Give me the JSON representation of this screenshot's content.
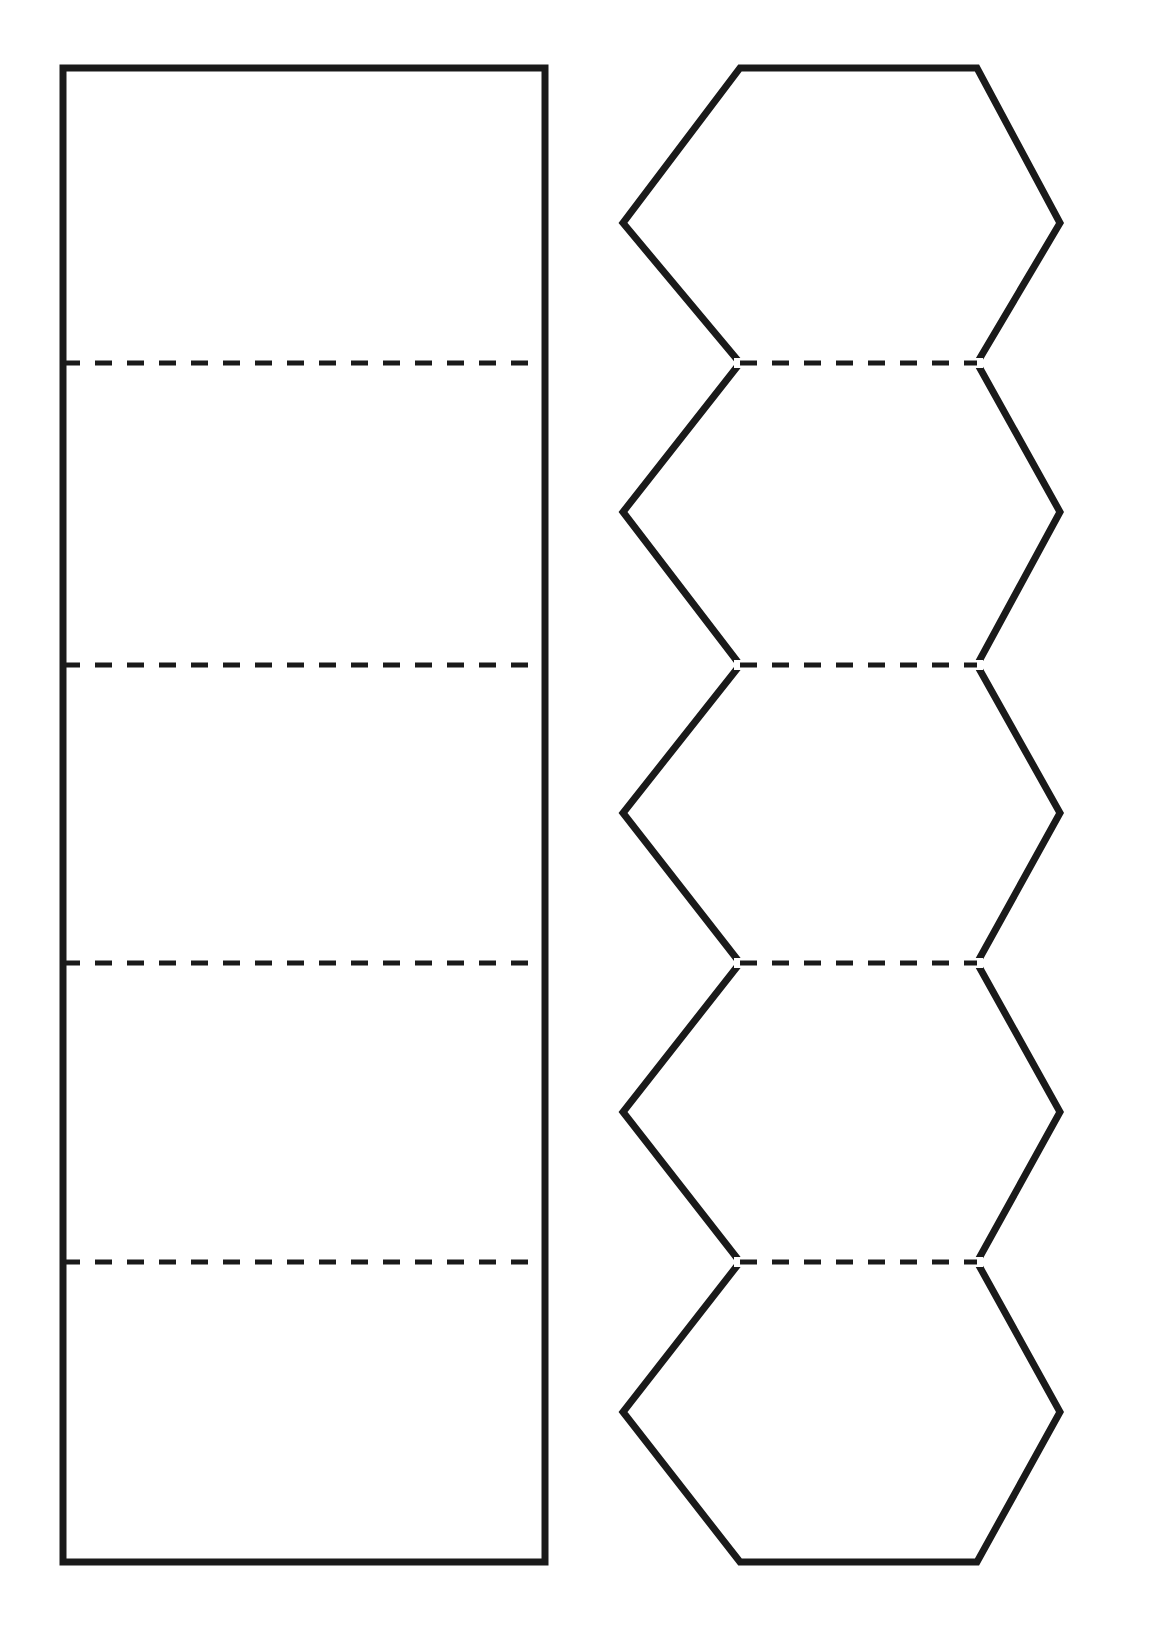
{
  "page": {
    "background_color": "#ffffff",
    "width": 1166,
    "height": 1626
  },
  "style": {
    "stroke_color": "#1a1a1a",
    "solid_stroke_width": 7,
    "dashed_stroke_width": 5,
    "dash_pattern": "17 15",
    "fill_color": "#ffffff"
  },
  "figures": {
    "rectangle_strip": {
      "name": "Rectangular side-face strip",
      "x": 63,
      "y": 68,
      "width": 482,
      "height": 1494,
      "panel_count": 5,
      "fold_line_count": 4,
      "fold_lines_y": [
        363,
        665,
        963,
        1262
      ],
      "fold_line_style": "dashed"
    },
    "hexagon_strip": {
      "name": "Hexagon strip",
      "hexagon_count": 5,
      "fold_line_count": 4,
      "fold_lines_y": [
        363,
        665,
        963,
        1262
      ],
      "fold_line_style": "dashed",
      "left_point_x": 623,
      "right_point_x": 1060,
      "flat_left_x": 740,
      "flat_right_x": 977,
      "top_y": 68,
      "bottom_y": 1562,
      "seam_ys": [
        363,
        665,
        963,
        1262
      ],
      "point_ys": [
        223,
        512,
        813,
        1112,
        1412
      ]
    }
  },
  "chart_data": {
    "type": "diagram",
    "elements": [
      {
        "id": "rectangle-strip",
        "shape": "rectangle",
        "stroke": "solid",
        "panels": 5,
        "bbox": [
          63,
          68,
          545,
          1562
        ]
      },
      {
        "id": "hexagon-strip",
        "shape": "hexagon-column",
        "stroke": "solid",
        "panels": 5,
        "bbox": [
          623,
          68,
          1060,
          1562
        ]
      }
    ],
    "fold_lines": [
      {
        "strip": "rectangle",
        "y": 363,
        "x1": 63,
        "x2": 545
      },
      {
        "strip": "rectangle",
        "y": 665,
        "x1": 63,
        "x2": 545
      },
      {
        "strip": "rectangle",
        "y": 963,
        "x1": 63,
        "x2": 545
      },
      {
        "strip": "rectangle",
        "y": 1262,
        "x1": 63,
        "x2": 545
      },
      {
        "strip": "hexagon",
        "y": 363,
        "x1": 740,
        "x2": 977
      },
      {
        "strip": "hexagon",
        "y": 665,
        "x1": 740,
        "x2": 977
      },
      {
        "strip": "hexagon",
        "y": 963,
        "x1": 740,
        "x2": 977
      },
      {
        "strip": "hexagon",
        "y": 1262,
        "x1": 740,
        "x2": 977
      }
    ]
  }
}
